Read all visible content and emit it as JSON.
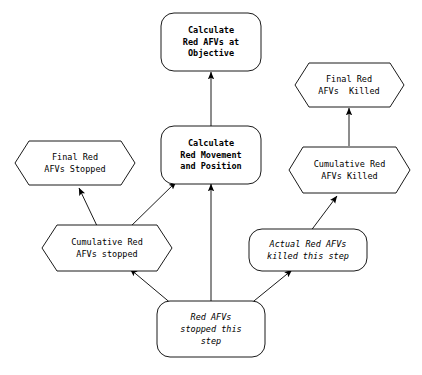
{
  "diagram": {
    "background_color": "#ffffff",
    "line_color": "#000000",
    "text_color": "#000000",
    "nodes": [
      {
        "id": "calc-red-afvs-objective",
        "shape": "rounded-rectangle",
        "style": "bold",
        "lines": [
          "Calculate",
          "Red AFVs at",
          "Objective"
        ]
      },
      {
        "id": "calc-red-movement-position",
        "shape": "rounded-rectangle",
        "style": "bold",
        "lines": [
          "Calculate",
          "Red Movement",
          "and Position"
        ]
      },
      {
        "id": "final-red-afvs-stopped",
        "shape": "hexagon",
        "style": "normal",
        "lines": [
          "Final Red",
          "AFVs Stopped"
        ]
      },
      {
        "id": "final-red-afvs-killed",
        "shape": "hexagon",
        "style": "normal",
        "lines": [
          "Final Red",
          "AFVs  Killed"
        ]
      },
      {
        "id": "cumulative-red-afvs-stopped",
        "shape": "hexagon",
        "style": "normal",
        "lines": [
          "Cumulative Red",
          "AFVs stopped"
        ]
      },
      {
        "id": "cumulative-red-afvs-killed",
        "shape": "hexagon",
        "style": "normal",
        "lines": [
          "Cumulative Red",
          "AFVs Killed"
        ]
      },
      {
        "id": "actual-red-afvs-killed-this-step",
        "shape": "rounded-rectangle",
        "style": "italic",
        "lines": [
          "Actual Red AFVs",
          "killed this step"
        ]
      },
      {
        "id": "red-afvs-stopped-this-step",
        "shape": "rounded-rectangle",
        "style": "italic",
        "lines": [
          "Red AFVs",
          "stopped this",
          "step"
        ]
      }
    ],
    "edges": [
      {
        "from": "calc-red-movement-position",
        "to": "calc-red-afvs-objective"
      },
      {
        "from": "cumulative-red-afvs-stopped",
        "to": "final-red-afvs-stopped"
      },
      {
        "from": "cumulative-red-afvs-stopped",
        "to": "calc-red-movement-position"
      },
      {
        "from": "cumulative-red-afvs-killed",
        "to": "final-red-afvs-killed"
      },
      {
        "from": "red-afvs-stopped-this-step",
        "to": "cumulative-red-afvs-stopped"
      },
      {
        "from": "red-afvs-stopped-this-step",
        "to": "calc-red-movement-position"
      },
      {
        "from": "red-afvs-stopped-this-step",
        "to": "actual-red-afvs-killed-this-step"
      },
      {
        "from": "actual-red-afvs-killed-this-step",
        "to": "cumulative-red-afvs-killed"
      }
    ]
  }
}
